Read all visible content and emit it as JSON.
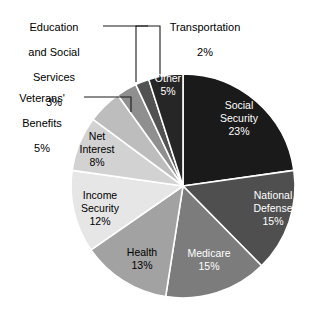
{
  "chart_data": {
    "type": "pie",
    "title": "",
    "subtitle": "",
    "xlabel": "",
    "ylabel": "",
    "legend_position": "none",
    "grid": false,
    "units": "percent",
    "start_angle_deg": 0,
    "direction": "clockwise",
    "categories": [
      "Social Security",
      "National Defense",
      "Medicare",
      "Health",
      "Income Security",
      "Net Interest",
      "Veterans' Benefits",
      "Education and Social Services",
      "Transportation",
      "Other"
    ],
    "values": [
      23,
      15,
      15,
      13,
      12,
      8,
      5,
      3,
      2,
      5
    ],
    "colors": [
      "#1a1a1a",
      "#4f4f4f",
      "#7c7c7c",
      "#a2a2a2",
      "#e6e6e6",
      "#d2d2d2",
      "#bdbdbd",
      "#8f8f8f",
      "#525252",
      "#262626"
    ],
    "slices": [
      {
        "name": "Social Security",
        "value": 23,
        "label": "Social Security",
        "pct_text": "23%",
        "color": "#1a1a1a",
        "label_placement": "inside",
        "text_color": "light"
      },
      {
        "name": "National Defense",
        "value": 15,
        "label": "National Defense",
        "pct_text": "15%",
        "color": "#4f4f4f",
        "label_placement": "inside",
        "text_color": "light"
      },
      {
        "name": "Medicare",
        "value": 15,
        "label": "Medicare",
        "pct_text": "15%",
        "color": "#7c7c7c",
        "label_placement": "inside",
        "text_color": "light"
      },
      {
        "name": "Health",
        "value": 13,
        "label": "Health",
        "pct_text": "13%",
        "color": "#a2a2a2",
        "label_placement": "inside",
        "text_color": "dark"
      },
      {
        "name": "Income Security",
        "value": 12,
        "label": "Income Security",
        "pct_text": "12%",
        "color": "#e6e6e6",
        "label_placement": "inside",
        "text_color": "dark"
      },
      {
        "name": "Net Interest",
        "value": 8,
        "label": "Net Interest",
        "pct_text": "8%",
        "color": "#d2d2d2",
        "label_placement": "inside",
        "text_color": "dark"
      },
      {
        "name": "Veterans' Benefits",
        "value": 5,
        "label": "Veterans' Benefits",
        "pct_text": "5%",
        "color": "#bdbdbd",
        "label_placement": "callout",
        "text_color": "dark"
      },
      {
        "name": "Education and Social Services",
        "value": 3,
        "label": "Education and Social Services",
        "pct_text": "3%",
        "color": "#8f8f8f",
        "label_placement": "callout",
        "text_color": "dark"
      },
      {
        "name": "Transportation",
        "value": 2,
        "label": "Transportation",
        "pct_text": "2%",
        "color": "#525252",
        "label_placement": "callout",
        "text_color": "dark"
      },
      {
        "name": "Other",
        "value": 5,
        "label": "Other",
        "pct_text": "5%",
        "color": "#262626",
        "label_placement": "inside",
        "text_color": "light"
      }
    ]
  },
  "callouts": {
    "education": {
      "line1": "Education",
      "line2": "and Social",
      "line3": "Services",
      "pct": "3%"
    },
    "veterans": {
      "line1": "Veterans'",
      "line2": "Benefits",
      "pct": "5%"
    },
    "transportation": {
      "line1": "Transportation",
      "pct": "2%"
    }
  },
  "inside_labels": {
    "social_security": {
      "line1": "Social",
      "line2": "Security",
      "pct": "23%"
    },
    "national_defense": {
      "line1": "National",
      "line2": "Defense",
      "pct": "15%"
    },
    "medicare": {
      "line1": "Medicare",
      "pct": "15%"
    },
    "health": {
      "line1": "Health",
      "pct": "13%"
    },
    "income_security": {
      "line1": "Income",
      "line2": "Security",
      "pct": "12%"
    },
    "net_interest": {
      "line1": "Net",
      "line2": "Interest",
      "pct": "8%"
    },
    "other": {
      "line1": "Other",
      "pct": "5%"
    }
  },
  "style": {
    "background": "#ffffff",
    "slice_separator": "#ffffff",
    "leader_line": "#1a1a1a"
  }
}
